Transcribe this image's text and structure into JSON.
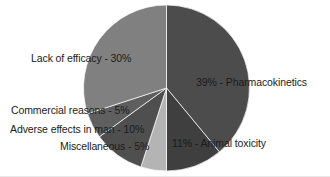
{
  "chart_data": {
    "type": "pie",
    "title": "",
    "subtitle": "",
    "xlabel": "",
    "ylabel": "",
    "legend_position": "none",
    "grid": false,
    "start_angle_deg": 0,
    "direction": "clockwise",
    "units": "percent",
    "categories": [
      "Pharmacokinetics",
      "Animal toxicity",
      "Miscellaneous",
      "Adverse effects in man",
      "Commercial reasons",
      "Lack of efficacy"
    ],
    "values": [
      39,
      11,
      5,
      10,
      5,
      30
    ],
    "labels": [
      "39% - Pharmacokinetics",
      "11% - Animal toxicity",
      "Miscellaneous - 5%",
      "Adverse effects in man - 10%",
      "Commercial reasons - 5%",
      "Lack of efficacy - 30%"
    ],
    "colors": [
      "#4c4c4c",
      "#3f3f3f",
      "#b4b4b4",
      "#4f4f4f",
      "#5f5f5f",
      "#808080"
    ],
    "slices": [
      {
        "name": "Pharmacokinetics",
        "value": 39,
        "label": "39% - Pharmacokinetics",
        "color": "#4c4c4c"
      },
      {
        "name": "Animal toxicity",
        "value": 11,
        "label": "11% - Animal toxicity",
        "color": "#3f3f3f"
      },
      {
        "name": "Miscellaneous",
        "value": 5,
        "label": "Miscellaneous - 5%",
        "color": "#b4b4b4"
      },
      {
        "name": "Adverse effects in man",
        "value": 10,
        "label": "Adverse effects in man - 10%",
        "color": "#4f4f4f"
      },
      {
        "name": "Commercial reasons",
        "value": 5,
        "label": "Commercial reasons - 5%",
        "color": "#5f5f5f"
      },
      {
        "name": "Lack of efficacy",
        "value": 30,
        "label": "Lack of efficacy - 30%",
        "color": "#808080"
      }
    ]
  },
  "figure": {
    "background_color": "#ffffff",
    "text_color": "#1b1b1b",
    "center_x": 166.5,
    "center_y": 88,
    "radius": 83
  }
}
